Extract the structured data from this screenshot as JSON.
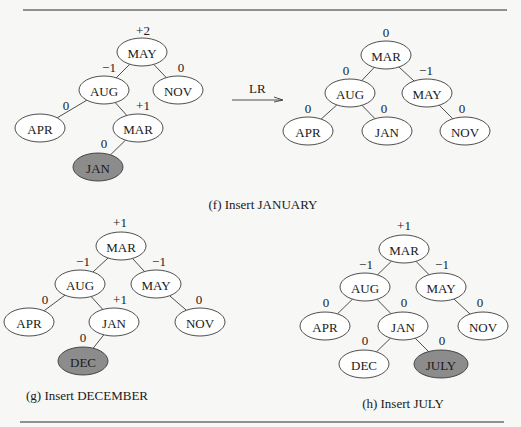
{
  "colors": {
    "node_fill": "#ffffff",
    "inserted_fill": "#8c8c8c",
    "stroke": "#3a3a3a",
    "background": "#f7f7f5"
  },
  "transition": {
    "label": "LR"
  },
  "panels": [
    {
      "id": "f-before",
      "nodes": [
        {
          "key": "may",
          "label": "MAY",
          "x": 142,
          "y": 52,
          "balance": "+2",
          "bx": 143,
          "by": 30
        },
        {
          "key": "aug",
          "label": "AUG",
          "x": 104,
          "y": 90,
          "balance": "−1",
          "bx": 109,
          "by": 67
        },
        {
          "key": "nov",
          "label": "NOV",
          "x": 178,
          "y": 90,
          "balance": "0",
          "bx": 181,
          "by": 67
        },
        {
          "key": "apr",
          "label": "APR",
          "x": 40,
          "y": 128,
          "balance": "0",
          "bx": 66,
          "by": 105
        },
        {
          "key": "mar",
          "label": "MAR",
          "x": 138,
          "y": 128,
          "balance": "+1",
          "bx": 143,
          "by": 105
        },
        {
          "key": "jan",
          "label": "JAN",
          "x": 98,
          "y": 167,
          "balance": "0",
          "bx": 104,
          "by": 143,
          "inserted": true
        }
      ],
      "edges": [
        [
          "may",
          "aug"
        ],
        [
          "may",
          "nov"
        ],
        [
          "aug",
          "apr"
        ],
        [
          "aug",
          "mar"
        ],
        [
          "mar",
          "jan"
        ]
      ]
    },
    {
      "id": "f-after",
      "nodes": [
        {
          "key": "mar",
          "label": "MAR",
          "x": 386,
          "y": 55,
          "balance": "0",
          "bx": 386,
          "by": 32
        },
        {
          "key": "aug",
          "label": "AUG",
          "x": 350,
          "y": 93,
          "balance": "0",
          "bx": 346,
          "by": 70
        },
        {
          "key": "may",
          "label": "MAY",
          "x": 427,
          "y": 93,
          "balance": "−1",
          "bx": 426,
          "by": 70
        },
        {
          "key": "apr",
          "label": "APR",
          "x": 308,
          "y": 131,
          "balance": "0",
          "bx": 308,
          "by": 108
        },
        {
          "key": "jan",
          "label": "JAN",
          "x": 387,
          "y": 131,
          "balance": "0",
          "bx": 384,
          "by": 108
        },
        {
          "key": "nov",
          "label": "NOV",
          "x": 465,
          "y": 131,
          "balance": "0",
          "bx": 462,
          "by": 108
        }
      ],
      "edges": [
        [
          "mar",
          "aug"
        ],
        [
          "mar",
          "may"
        ],
        [
          "aug",
          "apr"
        ],
        [
          "aug",
          "jan"
        ],
        [
          "may",
          "nov"
        ]
      ]
    },
    {
      "id": "g",
      "nodes": [
        {
          "key": "mar",
          "label": "MAR",
          "x": 121,
          "y": 246,
          "balance": "+1",
          "bx": 120,
          "by": 222
        },
        {
          "key": "aug",
          "label": "AUG",
          "x": 80,
          "y": 284,
          "balance": "−1",
          "bx": 83,
          "by": 261
        },
        {
          "key": "may",
          "label": "MAY",
          "x": 156,
          "y": 284,
          "balance": "−1",
          "bx": 159,
          "by": 261
        },
        {
          "key": "apr",
          "label": "APR",
          "x": 29,
          "y": 322,
          "balance": "0",
          "bx": 45,
          "by": 299
        },
        {
          "key": "jan",
          "label": "JAN",
          "x": 114,
          "y": 322,
          "balance": "+1",
          "bx": 120,
          "by": 299
        },
        {
          "key": "nov",
          "label": "NOV",
          "x": 200,
          "y": 322,
          "balance": "0",
          "bx": 199,
          "by": 299
        },
        {
          "key": "dec",
          "label": "DEC",
          "x": 83,
          "y": 361,
          "balance": "0",
          "bx": 83,
          "by": 337,
          "inserted": true
        }
      ],
      "edges": [
        [
          "mar",
          "aug"
        ],
        [
          "mar",
          "may"
        ],
        [
          "aug",
          "apr"
        ],
        [
          "aug",
          "jan"
        ],
        [
          "may",
          "nov"
        ],
        [
          "jan",
          "dec"
        ]
      ]
    },
    {
      "id": "h",
      "nodes": [
        {
          "key": "mar",
          "label": "MAR",
          "x": 404,
          "y": 249,
          "balance": "+1",
          "bx": 404,
          "by": 225
        },
        {
          "key": "aug",
          "label": "AUG",
          "x": 365,
          "y": 287,
          "balance": "−1",
          "bx": 366,
          "by": 264
        },
        {
          "key": "may",
          "label": "MAY",
          "x": 441,
          "y": 287,
          "balance": "−1",
          "bx": 442,
          "by": 264
        },
        {
          "key": "apr",
          "label": "APR",
          "x": 325,
          "y": 326,
          "balance": "0",
          "bx": 326,
          "by": 302
        },
        {
          "key": "jan",
          "label": "JAN",
          "x": 403,
          "y": 326,
          "balance": "0",
          "bx": 404,
          "by": 302
        },
        {
          "key": "nov",
          "label": "NOV",
          "x": 483,
          "y": 326,
          "balance": "0",
          "bx": 480,
          "by": 302
        },
        {
          "key": "dec",
          "label": "DEC",
          "x": 364,
          "y": 364,
          "balance": "0",
          "bx": 365,
          "by": 340
        },
        {
          "key": "july",
          "label": "JULY",
          "x": 441,
          "y": 364,
          "balance": "0",
          "bx": 442,
          "by": 340,
          "inserted": true
        }
      ],
      "edges": [
        [
          "mar",
          "aug"
        ],
        [
          "mar",
          "may"
        ],
        [
          "aug",
          "apr"
        ],
        [
          "aug",
          "jan"
        ],
        [
          "may",
          "nov"
        ],
        [
          "jan",
          "dec"
        ],
        [
          "jan",
          "july"
        ]
      ]
    }
  ],
  "captions": {
    "f": "(f) Insert JANUARY",
    "g": "(g) Insert DECEMBER",
    "h": "(h) Insert JULY"
  }
}
